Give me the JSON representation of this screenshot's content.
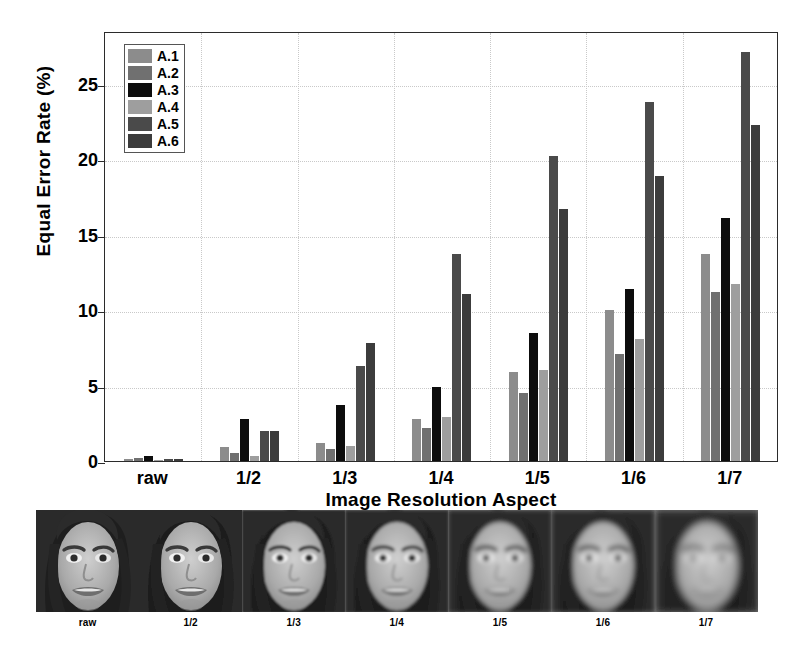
{
  "chart_data": {
    "type": "bar",
    "title": "",
    "xlabel": "Image Resolution Aspect",
    "ylabel": "Equal Error Rate (%)",
    "categories": [
      "raw",
      "1/2",
      "1/3",
      "1/4",
      "1/5",
      "1/6",
      "1/7"
    ],
    "ylim": [
      0,
      28.5
    ],
    "yticks": [
      0,
      5,
      10,
      15,
      20,
      25
    ],
    "grid": true,
    "legend_position": "upper-left",
    "series": [
      {
        "name": "A.1",
        "color": "#8c8c8c",
        "values": [
          0.15,
          0.9,
          1.2,
          2.8,
          5.9,
          10.0,
          13.7
        ]
      },
      {
        "name": "A.2",
        "color": "#707070",
        "values": [
          0.2,
          0.5,
          0.8,
          2.2,
          4.5,
          7.1,
          11.2
        ]
      },
      {
        "name": "A.3",
        "color": "#0d0d0d",
        "values": [
          0.3,
          2.8,
          3.7,
          4.9,
          8.5,
          11.4,
          16.1
        ]
      },
      {
        "name": "A.4",
        "color": "#9e9e9e",
        "values": [
          0.1,
          0.3,
          1.0,
          2.9,
          6.0,
          8.1,
          11.7
        ]
      },
      {
        "name": "A.5",
        "color": "#4a4a4a",
        "values": [
          0.12,
          2.0,
          6.3,
          13.7,
          20.2,
          23.8,
          27.1
        ]
      },
      {
        "name": "A.6",
        "color": "#3c3c3c",
        "values": [
          0.12,
          2.0,
          7.8,
          11.1,
          16.7,
          18.9,
          22.3
        ]
      }
    ]
  },
  "legend": {
    "items": [
      {
        "label": "A.1"
      },
      {
        "label": "A.2"
      },
      {
        "label": "A.3"
      },
      {
        "label": "A.4"
      },
      {
        "label": "A.5"
      },
      {
        "label": "A.6"
      }
    ]
  },
  "thumbnail_strip": {
    "items": [
      {
        "label": "raw",
        "blur": 0.0
      },
      {
        "label": "1/2",
        "blur": 0.6
      },
      {
        "label": "1/3",
        "blur": 1.1
      },
      {
        "label": "1/4",
        "blur": 1.6
      },
      {
        "label": "1/5",
        "blur": 2.2
      },
      {
        "label": "1/6",
        "blur": 2.9
      },
      {
        "label": "1/7",
        "blur": 3.7
      }
    ]
  }
}
